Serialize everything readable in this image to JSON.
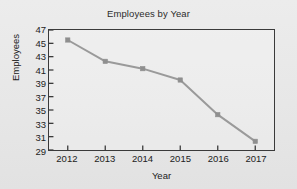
{
  "chart_data": {
    "type": "line",
    "title": "Employees by Year",
    "xlabel": "Year",
    "ylabel": "Employees",
    "categories": [
      "2012",
      "2013",
      "2014",
      "2015",
      "2016",
      "2017"
    ],
    "x": [
      2012,
      2013,
      2014,
      2015,
      2016,
      2017
    ],
    "values": [
      45.5,
      42.3,
      41.2,
      39.5,
      34.3,
      30.3
    ],
    "series": [
      {
        "name": "Employees",
        "values": [
          45.5,
          42.3,
          41.2,
          39.5,
          34.3,
          30.3
        ]
      }
    ],
    "ylim": [
      29,
      47
    ],
    "yticks": [
      29,
      31,
      33,
      35,
      37,
      39,
      41,
      43,
      45,
      47
    ],
    "ytick_labels": [
      "29",
      "31",
      "33",
      "35",
      "37",
      "39",
      "41",
      "43",
      "45",
      "47"
    ],
    "xtick_labels": [
      "2012",
      "2013",
      "2014",
      "2015",
      "2016",
      "2017"
    ],
    "grid": false,
    "legend": "none",
    "markers": "square",
    "line_color": "#9a9a9a",
    "marker_color": "#8f8f8f",
    "axis_color": "#3a3a3a",
    "background_color": "#e9e9e9",
    "text_color": "#222222"
  }
}
